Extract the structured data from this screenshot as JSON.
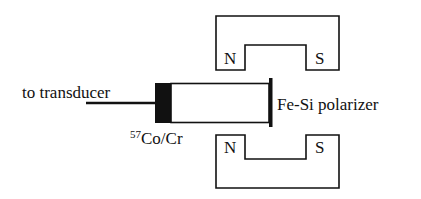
{
  "diagram": {
    "labels": {
      "transducer": "to transducer",
      "source_isotope": "57",
      "source_rest": "Co/Cr",
      "polarizer": "Fe-Si polarizer",
      "top_magnet_north": "N",
      "top_magnet_south": "S",
      "bottom_magnet_north": "N",
      "bottom_magnet_south": "S"
    },
    "colors": {
      "line": "#111111",
      "background": "#ffffff"
    }
  }
}
